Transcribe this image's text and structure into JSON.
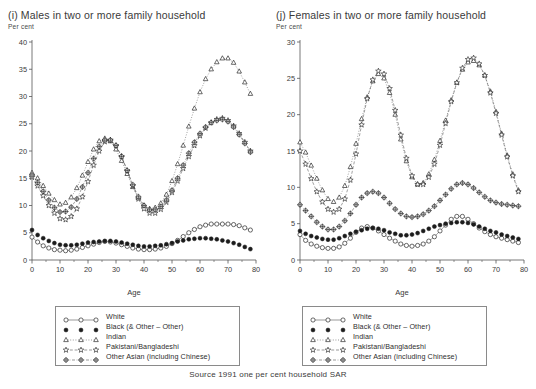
{
  "figure": {
    "source_note": "Source 1991 one per cent household SAR",
    "unit_label": "Per cent",
    "xlabel": "Age"
  },
  "legend": {
    "entries": [
      {
        "label": "White",
        "marker": "open-circle",
        "line": "solid"
      },
      {
        "label": "Black (& Other – Other)",
        "marker": "filled-circle",
        "line": "none"
      },
      {
        "label": "Indian",
        "marker": "open-triangle",
        "line": "dotted"
      },
      {
        "label": "Pakistani/Bangladeshi",
        "marker": "open-star",
        "line": "dashed"
      },
      {
        "label": "Other Asian (including Chinese)",
        "marker": "crossed-circle",
        "line": "dash-dot"
      }
    ]
  },
  "chart_data": [
    {
      "type": "line",
      "panel": "i",
      "title": "(i) Males in two or more family household",
      "xlabel": "Age",
      "ylabel": "Per cent",
      "unit": "Per cent",
      "xlim": [
        0,
        80
      ],
      "ylim": [
        0,
        40
      ],
      "xticks": [
        0,
        10,
        20,
        30,
        40,
        50,
        60,
        70,
        80
      ],
      "yticks": [
        0,
        5,
        10,
        15,
        20,
        25,
        30,
        35,
        40
      ],
      "grid": false,
      "legend_position": "below",
      "x": [
        0,
        2,
        4,
        6,
        8,
        10,
        12,
        14,
        16,
        18,
        20,
        22,
        24,
        26,
        28,
        30,
        32,
        34,
        36,
        38,
        40,
        42,
        44,
        46,
        48,
        50,
        52,
        54,
        56,
        58,
        60,
        62,
        64,
        66,
        68,
        70,
        72,
        74,
        76,
        78
      ],
      "series": [
        {
          "name": "White",
          "values": [
            4.2,
            3.3,
            2.6,
            2.2,
            1.9,
            1.8,
            1.7,
            1.8,
            2.0,
            2.3,
            2.6,
            2.9,
            3.2,
            3.4,
            3.3,
            3.1,
            2.8,
            2.5,
            2.2,
            2.0,
            1.9,
            1.9,
            2.0,
            2.2,
            2.5,
            3.0,
            3.6,
            4.3,
            5.0,
            5.6,
            6.1,
            6.4,
            6.6,
            6.6,
            6.6,
            6.6,
            6.5,
            6.3,
            5.9,
            5.5
          ]
        },
        {
          "name": "Black (& Other – Other)",
          "values": [
            5.5,
            4.6,
            4.0,
            3.5,
            3.1,
            2.8,
            2.7,
            2.7,
            2.8,
            3.0,
            3.2,
            3.3,
            3.4,
            3.5,
            3.5,
            3.4,
            3.2,
            3.0,
            2.8,
            2.6,
            2.5,
            2.5,
            2.6,
            2.7,
            2.9,
            3.1,
            3.4,
            3.6,
            3.8,
            3.9,
            4.0,
            4.0,
            3.9,
            3.8,
            3.6,
            3.4,
            3.1,
            2.8,
            2.4,
            2.0
          ]
        },
        {
          "name": "Indian",
          "values": [
            16.0,
            15.0,
            13.6,
            12.2,
            11.0,
            10.2,
            10.5,
            11.5,
            13.2,
            15.5,
            18.0,
            20.3,
            21.8,
            22.3,
            21.8,
            20.3,
            18.2,
            15.8,
            13.4,
            11.4,
            10.0,
            9.4,
            9.6,
            10.4,
            12.0,
            14.5,
            17.6,
            21.0,
            24.5,
            27.8,
            30.8,
            33.2,
            35.0,
            36.3,
            37.0,
            37.0,
            36.2,
            34.6,
            32.6,
            30.5
          ]
        },
        {
          "name": "Pakistani/Bangladeshi",
          "values": [
            15.2,
            13.6,
            11.8,
            10.0,
            8.6,
            7.6,
            7.4,
            8.0,
            9.4,
            11.6,
            14.4,
            17.4,
            20.0,
            21.7,
            22.0,
            21.0,
            19.0,
            16.4,
            13.6,
            11.2,
            9.4,
            8.6,
            8.6,
            9.3,
            10.6,
            12.4,
            14.5,
            16.8,
            19.0,
            21.0,
            22.8,
            24.2,
            25.2,
            25.8,
            26.0,
            25.6,
            24.6,
            23.2,
            21.6,
            20.0
          ]
        },
        {
          "name": "Other Asian (including Chinese)",
          "values": [
            15.6,
            14.2,
            12.6,
            11.0,
            9.6,
            8.8,
            8.9,
            9.7,
            11.2,
            13.4,
            16.0,
            18.6,
            20.8,
            22.0,
            22.0,
            21.0,
            19.0,
            16.4,
            13.8,
            11.6,
            10.0,
            9.2,
            9.2,
            9.8,
            11.0,
            12.8,
            15.0,
            17.4,
            19.6,
            21.6,
            23.2,
            24.4,
            25.2,
            25.6,
            25.8,
            25.4,
            24.4,
            23.0,
            21.4,
            19.8
          ]
        }
      ]
    },
    {
      "type": "line",
      "panel": "j",
      "title": "(j) Females in two or more family household",
      "xlabel": "Age",
      "ylabel": "Per cent",
      "unit": "Per cent",
      "xlim": [
        0,
        80
      ],
      "ylim": [
        0,
        30
      ],
      "xticks": [
        0,
        10,
        20,
        30,
        40,
        50,
        60,
        70,
        80
      ],
      "yticks": [
        0,
        5,
        10,
        15,
        20,
        25,
        30
      ],
      "grid": false,
      "legend_position": "below",
      "x": [
        0,
        2,
        4,
        6,
        8,
        10,
        12,
        14,
        16,
        18,
        20,
        22,
        24,
        26,
        28,
        30,
        32,
        34,
        36,
        38,
        40,
        42,
        44,
        46,
        48,
        50,
        52,
        54,
        56,
        58,
        60,
        62,
        64,
        66,
        68,
        70,
        72,
        74,
        76,
        78
      ],
      "series": [
        {
          "name": "White",
          "values": [
            3.5,
            2.7,
            2.2,
            1.9,
            1.7,
            1.6,
            1.6,
            1.8,
            2.3,
            3.0,
            3.8,
            4.4,
            4.6,
            4.4,
            4.0,
            3.5,
            3.0,
            2.6,
            2.2,
            2.0,
            1.9,
            2.0,
            2.2,
            2.6,
            3.2,
            4.0,
            4.8,
            5.6,
            6.0,
            6.0,
            5.6,
            5.0,
            4.4,
            3.9,
            3.5,
            3.2,
            3.0,
            2.8,
            2.6,
            2.4
          ]
        },
        {
          "name": "Black (& Other – Other)",
          "values": [
            4.0,
            3.6,
            3.3,
            3.1,
            2.9,
            2.8,
            2.8,
            3.0,
            3.3,
            3.6,
            3.9,
            4.1,
            4.3,
            4.4,
            4.3,
            4.1,
            3.8,
            3.6,
            3.4,
            3.4,
            3.5,
            3.7,
            4.0,
            4.3,
            4.6,
            4.8,
            5.0,
            5.1,
            5.2,
            5.2,
            5.1,
            4.9,
            4.6,
            4.3,
            4.0,
            3.8,
            3.5,
            3.3,
            3.1,
            2.9
          ]
        },
        {
          "name": "Indian",
          "values": [
            16.2,
            14.8,
            13.0,
            11.2,
            9.6,
            8.4,
            8.0,
            8.6,
            10.2,
            12.8,
            16.0,
            19.4,
            22.4,
            24.6,
            25.6,
            25.0,
            23.0,
            20.0,
            16.6,
            13.6,
            11.4,
            10.4,
            10.6,
            11.8,
            13.8,
            16.4,
            19.2,
            22.0,
            24.4,
            26.2,
            27.2,
            27.4,
            26.8,
            25.4,
            23.2,
            20.4,
            17.4,
            14.4,
            11.8,
            9.6
          ]
        },
        {
          "name": "Pakistani/Bangladeshi",
          "values": [
            15.0,
            13.2,
            11.2,
            9.4,
            8.0,
            7.0,
            6.6,
            7.0,
            8.4,
            11.0,
            14.6,
            18.6,
            22.2,
            24.8,
            26.0,
            25.6,
            23.6,
            20.6,
            17.2,
            14.0,
            11.6,
            10.4,
            10.4,
            11.4,
            13.2,
            15.8,
            18.8,
            21.8,
            24.4,
            26.4,
            27.6,
            27.8,
            27.0,
            25.4,
            23.0,
            20.2,
            17.2,
            14.2,
            11.6,
            9.4
          ]
        },
        {
          "name": "Other Asian (including Chinese)",
          "values": [
            7.6,
            6.8,
            6.0,
            5.2,
            4.6,
            4.2,
            4.2,
            4.6,
            5.4,
            6.4,
            7.6,
            8.6,
            9.2,
            9.4,
            9.2,
            8.6,
            7.8,
            7.0,
            6.4,
            6.0,
            5.9,
            6.0,
            6.3,
            6.8,
            7.4,
            8.2,
            9.0,
            9.8,
            10.4,
            10.6,
            10.4,
            9.9,
            9.3,
            8.7,
            8.2,
            7.9,
            7.7,
            7.6,
            7.5,
            7.4
          ]
        }
      ]
    }
  ]
}
